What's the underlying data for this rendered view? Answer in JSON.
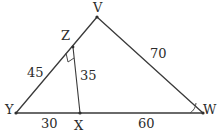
{
  "figure": {
    "type": "geometry-diagram",
    "background_color": "#ffffff",
    "line_color": "#3a3a3a",
    "text_color": "#2b2b2b",
    "vertices": [
      {
        "name": "V",
        "label": "V",
        "x": 97,
        "y": 17,
        "label_x": 93,
        "label_y": 1
      },
      {
        "name": "Z",
        "label": "Z",
        "x": 73,
        "y": 47,
        "label_x": 61,
        "label_y": 29
      },
      {
        "name": "Y",
        "label": "Y",
        "x": 16,
        "y": 113,
        "label_x": 5,
        "label_y": 103
      },
      {
        "name": "X",
        "label": "X",
        "x": 80,
        "y": 113,
        "label_x": 74,
        "label_y": 119
      },
      {
        "name": "W",
        "label": "W",
        "x": 203,
        "y": 113,
        "label_x": 203,
        "label_y": 103
      }
    ],
    "segments": [
      {
        "name": "YV",
        "from": "Y",
        "to": "V"
      },
      {
        "name": "VW",
        "from": "V",
        "to": "W"
      },
      {
        "name": "YW",
        "from": "Y",
        "to": "W"
      },
      {
        "name": "ZX",
        "from": "Z",
        "to": "X"
      }
    ],
    "measures": [
      {
        "name": "YZ",
        "value": "45",
        "label_x": 27,
        "label_y": 66
      },
      {
        "name": "ZX",
        "value": "35",
        "label_x": 80,
        "label_y": 69
      },
      {
        "name": "VW",
        "value": "70",
        "label_x": 150,
        "label_y": 47
      },
      {
        "name": "YX",
        "value": "30",
        "label_x": 41,
        "label_y": 117
      },
      {
        "name": "XW",
        "value": "60",
        "label_x": 138,
        "label_y": 117
      }
    ],
    "angle_markers": [
      {
        "name": "right-angle-at-z",
        "vertex": "Z",
        "kind": "right-angle"
      },
      {
        "name": "angle-arc-at-w",
        "vertex": "W",
        "kind": "arc"
      }
    ]
  }
}
